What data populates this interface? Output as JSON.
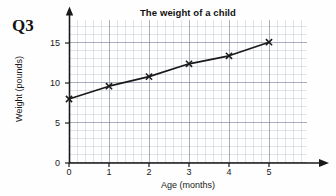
{
  "question": {
    "label": "Q3"
  },
  "chart_data": {
    "type": "line",
    "title": "The weight of a child",
    "xlabel": "Age (months)",
    "ylabel": "Weight (pounds)",
    "x": [
      0,
      1,
      2,
      3,
      4,
      5
    ],
    "values": [
      8.0,
      9.6,
      10.8,
      12.4,
      13.4,
      15.1
    ],
    "series": [
      {
        "name": "Weight",
        "x": [
          0,
          1,
          2,
          3,
          4,
          5
        ],
        "values": [
          8.0,
          9.6,
          10.8,
          12.4,
          13.4,
          15.1
        ]
      }
    ],
    "xlim": [
      0,
      6
    ],
    "ylim": [
      0,
      17.9
    ],
    "xticks": [
      "0",
      "1",
      "2",
      "3",
      "4",
      "5"
    ],
    "yticks": [
      "0",
      "5",
      "10",
      "15"
    ],
    "xtick_values": [
      0,
      1,
      2,
      3,
      4,
      5
    ],
    "ytick_values": [
      0,
      5,
      10,
      15
    ],
    "grid": true,
    "legend": "none",
    "marker": "x",
    "line_color": "#1a1a1a",
    "grid_color": "#98a2b5"
  }
}
